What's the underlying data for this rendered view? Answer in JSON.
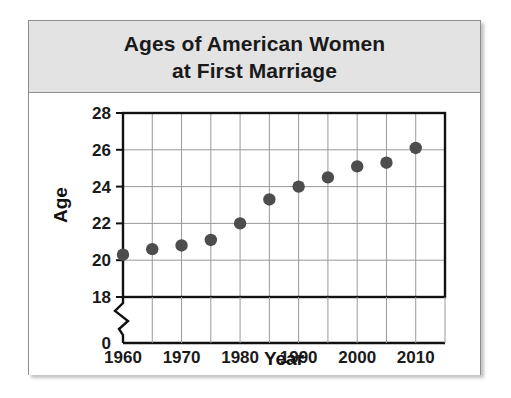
{
  "figure": {
    "title_lines": [
      "Ages of American Women",
      "at First Marriage"
    ],
    "title_full": "Ages of American Women at First Marriage",
    "banner_color": "#e3e3e3",
    "frame_color": "#8d8d8d",
    "marker_color": "#4d4d4d",
    "grid_color": "#999999",
    "axis_color": "#111111",
    "background": "#ffffff"
  },
  "chart_data": {
    "type": "scatter",
    "title": "Ages of American Women at First Marriage",
    "xlabel": "Year",
    "ylabel": "Age",
    "x": [
      1960,
      1965,
      1970,
      1975,
      1980,
      1985,
      1990,
      1995,
      2000,
      2005,
      2010
    ],
    "values": [
      20.3,
      20.6,
      20.8,
      21.1,
      22.0,
      23.3,
      24.0,
      24.5,
      25.1,
      25.3,
      26.1
    ],
    "points": [
      {
        "year": 1960,
        "age": 20.3
      },
      {
        "year": 1965,
        "age": 20.6
      },
      {
        "year": 1970,
        "age": 20.8
      },
      {
        "year": 1975,
        "age": 21.1
      },
      {
        "year": 1980,
        "age": 22.0
      },
      {
        "year": 1985,
        "age": 23.3
      },
      {
        "year": 1990,
        "age": 24.0
      },
      {
        "year": 1995,
        "age": 24.5
      },
      {
        "year": 2000,
        "age": 25.1
      },
      {
        "year": 2005,
        "age": 25.3
      },
      {
        "year": 2010,
        "age": 26.1
      }
    ],
    "xlim": [
      1960,
      2015
    ],
    "ylim": [
      18,
      28
    ],
    "x_tick_labels": [
      "1960",
      "1970",
      "1980",
      "1990",
      "2000",
      "2010"
    ],
    "x_major_ticks": [
      1960,
      1970,
      1980,
      1990,
      2000,
      2010
    ],
    "x_minor_ticks": [
      1965,
      1975,
      1985,
      1995,
      2005,
      2015
    ],
    "y_tick_labels": [
      "0",
      "18",
      "20",
      "22",
      "24",
      "26",
      "28"
    ],
    "y_ticks": [
      18,
      20,
      22,
      24,
      26,
      28
    ],
    "y_zero_label": "0",
    "axis_break": true,
    "grid": true,
    "legend": null
  }
}
